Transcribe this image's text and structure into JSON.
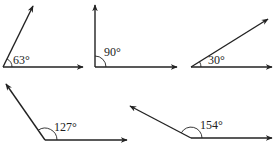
{
  "diagram": {
    "title": "",
    "angles": [
      {
        "id": "angle-63",
        "label": "63°",
        "degrees": 63
      },
      {
        "id": "angle-90",
        "label": "90°",
        "degrees": 90
      },
      {
        "id": "angle-30",
        "label": "30°",
        "degrees": 30
      },
      {
        "id": "angle-127",
        "label": "127°",
        "degrees": 127
      },
      {
        "id": "angle-154",
        "label": "154°",
        "degrees": 154
      }
    ],
    "colors": {
      "line": "#222222",
      "background": "#ffffff"
    }
  }
}
